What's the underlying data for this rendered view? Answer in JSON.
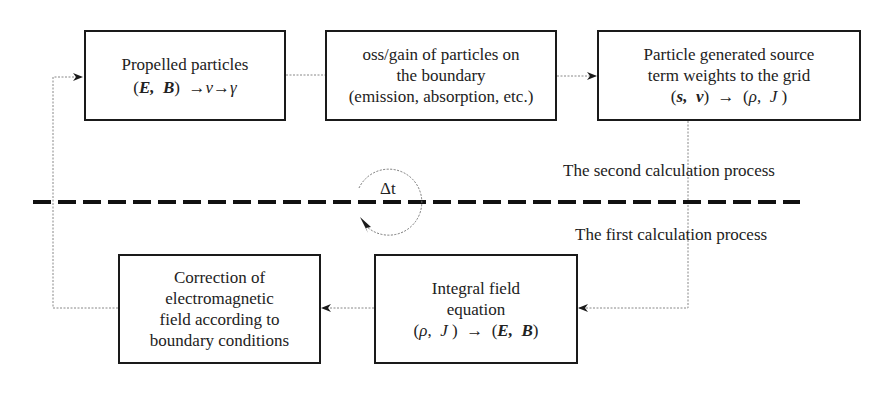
{
  "diagram": {
    "boxes": {
      "propelled": {
        "line1": "Propelled particles",
        "math": "(E, B) →v→γ"
      },
      "boundary_loss": {
        "line1": "oss/gain of particles on",
        "line2": "the boundary",
        "line3": "(emission, absorption, etc.)"
      },
      "source_weights": {
        "line1": "Particle generated source",
        "line2": "term weights to the grid",
        "math": "(s, v) → (ρ, J)"
      },
      "integral_field": {
        "line1": "Integral field",
        "line2": "equation",
        "math": "(ρ, J) → (E, B)"
      },
      "correction": {
        "line1": "Correction of",
        "line2": "electromagnetic",
        "line3": "field according to",
        "line4": "boundary conditions"
      }
    },
    "labels": {
      "second_process": "The second calculation process",
      "first_process": "The first calculation process",
      "timestep": "Δt"
    },
    "math_parts": {
      "E": "E",
      "B": "B",
      "s": "s",
      "v": "v",
      "gamma": "γ",
      "rho": "ρ",
      "J": "J",
      "arrow": "→",
      "lparen": "(",
      "rparen": ")",
      "comma": ","
    },
    "colors": {
      "box_border": "#1a1a1a",
      "connector": "#888888",
      "dashed_separator": "#111111",
      "text": "#222222"
    }
  }
}
